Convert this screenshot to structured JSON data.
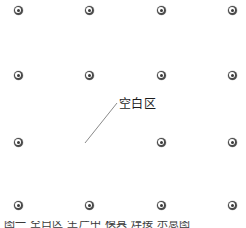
{
  "figure": {
    "title": "",
    "background_color": "#ffffff",
    "width": 246,
    "height": 228
  },
  "callout": {
    "label": "空白区",
    "label_x": 119,
    "label_y": 97,
    "leader_line": {
      "x1": 85,
      "y1": 143,
      "x2": 117,
      "y2": 103,
      "color": "#8a8a8a",
      "width": 1
    }
  },
  "caption": {
    "text": "图一  空白区  生产中  模具  焊接  示意图",
    "visible": "clipped-at-bottom-edge"
  },
  "chart_data": {
    "type": "scatter",
    "title": "",
    "xlabel": "",
    "ylabel": "",
    "grid": false,
    "legend": false,
    "xlim": [
      0,
      246
    ],
    "ylim": [
      0,
      228
    ],
    "marker_color": "#4a4a4a",
    "marker_style": "concentric-circle",
    "marker_size": 9,
    "columns": [
      18,
      89,
      161,
      232
    ],
    "rows": [
      10,
      75,
      142,
      205
    ],
    "points": [
      {
        "x": 18,
        "y": 10,
        "present": true
      },
      {
        "x": 89,
        "y": 10,
        "present": true
      },
      {
        "x": 161,
        "y": 10,
        "present": true
      },
      {
        "x": 232,
        "y": 10,
        "present": true
      },
      {
        "x": 18,
        "y": 75,
        "present": true
      },
      {
        "x": 89,
        "y": 75,
        "present": true
      },
      {
        "x": 161,
        "y": 75,
        "present": true
      },
      {
        "x": 232,
        "y": 75,
        "present": true
      },
      {
        "x": 18,
        "y": 142,
        "present": true
      },
      {
        "x": 89,
        "y": 142,
        "present": false
      },
      {
        "x": 161,
        "y": 142,
        "present": true
      },
      {
        "x": 232,
        "y": 142,
        "present": true
      },
      {
        "x": 18,
        "y": 205,
        "present": true
      },
      {
        "x": 89,
        "y": 205,
        "present": true
      },
      {
        "x": 161,
        "y": 205,
        "present": true
      },
      {
        "x": 232,
        "y": 205,
        "present": true
      }
    ],
    "missing_point": {
      "x": 89,
      "y": 142,
      "annotation": "空白区"
    }
  }
}
